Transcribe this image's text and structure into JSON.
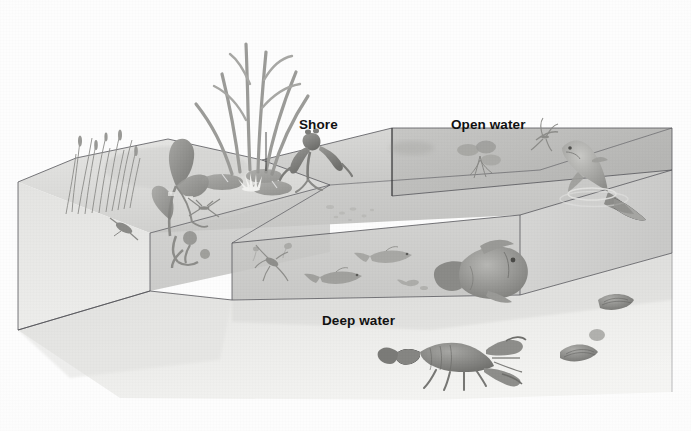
{
  "figure": {
    "style": "grayscale airbrush scientific illustration",
    "background_color": "#fdfdfd",
    "ink_color": "#3a3a3a",
    "caption_partial": ""
  },
  "labels": {
    "shore": "Shore",
    "open_water": "Open water",
    "deep_water": "Deep water"
  },
  "zones": [
    {
      "id": "shore",
      "label": "Shore",
      "description": "Shallow margin with emergent plants, lily pads, frog and insects"
    },
    {
      "id": "open-water",
      "label": "Open water",
      "description": "Sunlit surface layer with duckweed, jumping fish and mayfly"
    },
    {
      "id": "deep-water",
      "label": "Deep water",
      "description": "Lower layer and bottom with large fish, crayfish and clams"
    }
  ],
  "organisms": [
    {
      "name": "dragonfly",
      "zone": "shore",
      "icon": "dragonfly-icon"
    },
    {
      "name": "cattail-reeds",
      "zone": "shore",
      "icon": "reeds-icon"
    },
    {
      "name": "sedge-grass",
      "zone": "shore",
      "icon": "sedge-icon"
    },
    {
      "name": "broadleaf-plant",
      "zone": "shore",
      "icon": "arrowhead-plant-icon"
    },
    {
      "name": "water-lily",
      "zone": "shore",
      "icon": "water-lily-icon"
    },
    {
      "name": "water-strider",
      "zone": "shore",
      "icon": "water-strider-icon"
    },
    {
      "name": "frog",
      "zone": "shore",
      "icon": "frog-icon"
    },
    {
      "name": "tadpole-snail",
      "zone": "shore",
      "icon": "snail-icon"
    },
    {
      "name": "diving-beetle",
      "zone": "shore",
      "icon": "beetle-icon"
    },
    {
      "name": "duckweed",
      "zone": "open-water",
      "icon": "duckweed-icon"
    },
    {
      "name": "mayfly",
      "zone": "open-water",
      "icon": "mayfly-icon"
    },
    {
      "name": "jumping-fish",
      "zone": "open-water",
      "icon": "jumping-fish-icon"
    },
    {
      "name": "minnow-school",
      "zone": "deep-water",
      "icon": "minnow-icon"
    },
    {
      "name": "water-boatman",
      "zone": "deep-water",
      "icon": "water-boatman-icon"
    },
    {
      "name": "plankton",
      "zone": "deep-water",
      "icon": "plankton-icon"
    },
    {
      "name": "sunfish",
      "zone": "deep-water",
      "icon": "sunfish-icon"
    },
    {
      "name": "crayfish",
      "zone": "deep-water",
      "icon": "crayfish-icon"
    },
    {
      "name": "clams",
      "zone": "deep-water",
      "icon": "clam-icon"
    }
  ]
}
